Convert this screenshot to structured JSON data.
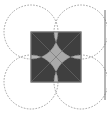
{
  "figure": {
    "square": {
      "x": 31,
      "y": 32,
      "size": 50,
      "fill": "#a9a9a9",
      "stroke": "#7a7a7a"
    },
    "circles": [
      {
        "name": "top-left",
        "cx": 31,
        "cy": 32,
        "r": 27
      },
      {
        "name": "top-right",
        "cx": 81,
        "cy": 32,
        "r": 27
      },
      {
        "name": "bottom-left",
        "cx": 31,
        "cy": 82,
        "r": 27
      },
      {
        "name": "bottom-right",
        "cx": 81,
        "cy": 82,
        "r": 27
      }
    ],
    "colors": {
      "base": "#a9a9a9",
      "petal": "#b8b8b8",
      "dark": "#3f3f3f",
      "circle_stroke": "#8a8a8a",
      "edge_line": "#6f6f6f"
    },
    "right_edge_line": {
      "x": 105,
      "y1": 10,
      "y2": 100
    }
  }
}
